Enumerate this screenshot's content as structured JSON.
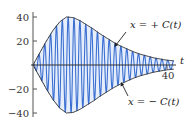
{
  "chart_data": {
    "type": "line",
    "title": "",
    "xlabel": "t",
    "ylabel": "",
    "xlim": [
      0,
      42
    ],
    "ylim": [
      -45,
      45
    ],
    "x_ticks": [
      40
    ],
    "x_tick_labels": [
      "40"
    ],
    "y_ticks": [
      40,
      20,
      -20,
      -40
    ],
    "y_tick_labels": [
      "40",
      "20",
      "−20",
      "−40"
    ],
    "grid": false,
    "legend": null,
    "series": [
      {
        "name": "x(t) oscillation",
        "color": "#3b6fd1",
        "description": "high-frequency oscillation bounded by ±C(t)",
        "frequency_cycles_over_range": 24
      },
      {
        "name": "C(t) envelope",
        "color": "#333333",
        "t": [
          0,
          2,
          4,
          6,
          8,
          10,
          12,
          14,
          16,
          18,
          20,
          22,
          24,
          26,
          28,
          30,
          32,
          34,
          36,
          38,
          40,
          42
        ],
        "values": [
          0,
          10,
          20,
          29,
          36,
          40,
          39.5,
          37,
          33.5,
          30,
          26,
          22.5,
          19,
          16,
          13.5,
          11,
          9,
          7.5,
          6,
          5,
          4,
          3.5
        ]
      },
      {
        "name": "-C(t) envelope",
        "color": "#333333",
        "t": [
          0,
          2,
          4,
          6,
          8,
          10,
          12,
          14,
          16,
          18,
          20,
          22,
          24,
          26,
          28,
          30,
          32,
          34,
          36,
          38,
          40,
          42
        ],
        "values": [
          0,
          -10,
          -20,
          -29,
          -36,
          -40,
          -39.5,
          -37,
          -33.5,
          -30,
          -26,
          -22.5,
          -19,
          -16,
          -13.5,
          -11,
          -9,
          -7.5,
          -6,
          -5,
          -4,
          -3.5
        ]
      }
    ],
    "annotations": [
      {
        "text": "x = + C(t)",
        "points_to": "upper envelope"
      },
      {
        "text": "x = − C(t)",
        "points_to": "lower envelope"
      }
    ]
  },
  "labels": {
    "x_axis": "t",
    "x_tick_40": "40",
    "y_tick_40": "40",
    "y_tick_20": "20",
    "y_tick_m20": "−20",
    "y_tick_m40": "−40",
    "upper_annotation": "x = + C(t)",
    "lower_annotation": "x = − C(t)"
  }
}
